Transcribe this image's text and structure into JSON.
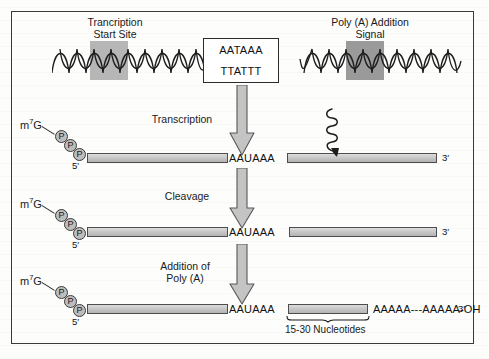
{
  "figure": {
    "type": "diagram"
  },
  "dna": {
    "label_left": "Trancription\nStart Site",
    "label_left_line1": "Trancription",
    "label_left_line2": "Start Site",
    "label_right_line1": "Poly (A) Addition",
    "label_right_line2": "Signal",
    "sequence_box": {
      "top_strand": "AATAAA",
      "bottom_strand": "TTATTT"
    },
    "highlight_left_color": "#b6b6b6",
    "highlight_right_color": "#9a9a9a"
  },
  "steps": [
    {
      "name": "transcription",
      "arrow_label_line1": "Transcription",
      "arrow_label_line2": "",
      "cap_label": "m",
      "cap_superscript": "7",
      "cap_base": "G",
      "phosphates": [
        "P",
        "P",
        "P"
      ],
      "five_prime": "5′",
      "signal": "AAUAAA",
      "three_prime": "3′",
      "cleavage_marker": "squiggle-arrow"
    },
    {
      "name": "cleavage",
      "arrow_label_line1": "Cleavage",
      "arrow_label_line2": "",
      "cap_label": "m",
      "cap_superscript": "7",
      "cap_base": "G",
      "phosphates": [
        "P",
        "P",
        "P"
      ],
      "five_prime": "5′",
      "signal": "AAUAAA",
      "three_prime": "3′"
    },
    {
      "name": "polyadenylation",
      "arrow_label_line1": "Addition of",
      "arrow_label_line2": "Poly (A)",
      "cap_label": "m",
      "cap_superscript": "7",
      "cap_base": "G",
      "phosphates": [
        "P",
        "P",
        "P"
      ],
      "five_prime": "5′",
      "signal": "AAUAAA",
      "poly_a_tail": "AAAAA---AAAAA-OH",
      "three_prime": "3′",
      "brace_label": "15-30 Nucleotides"
    }
  ],
  "colors": {
    "bar_fill": "#c9c9c9",
    "bar_stroke": "#4d4d4d",
    "arrow_fill": "#c4c4c4",
    "arrow_stroke": "#585858",
    "frame_stroke": "#3a3a3a",
    "text": "#1a1a1a"
  }
}
